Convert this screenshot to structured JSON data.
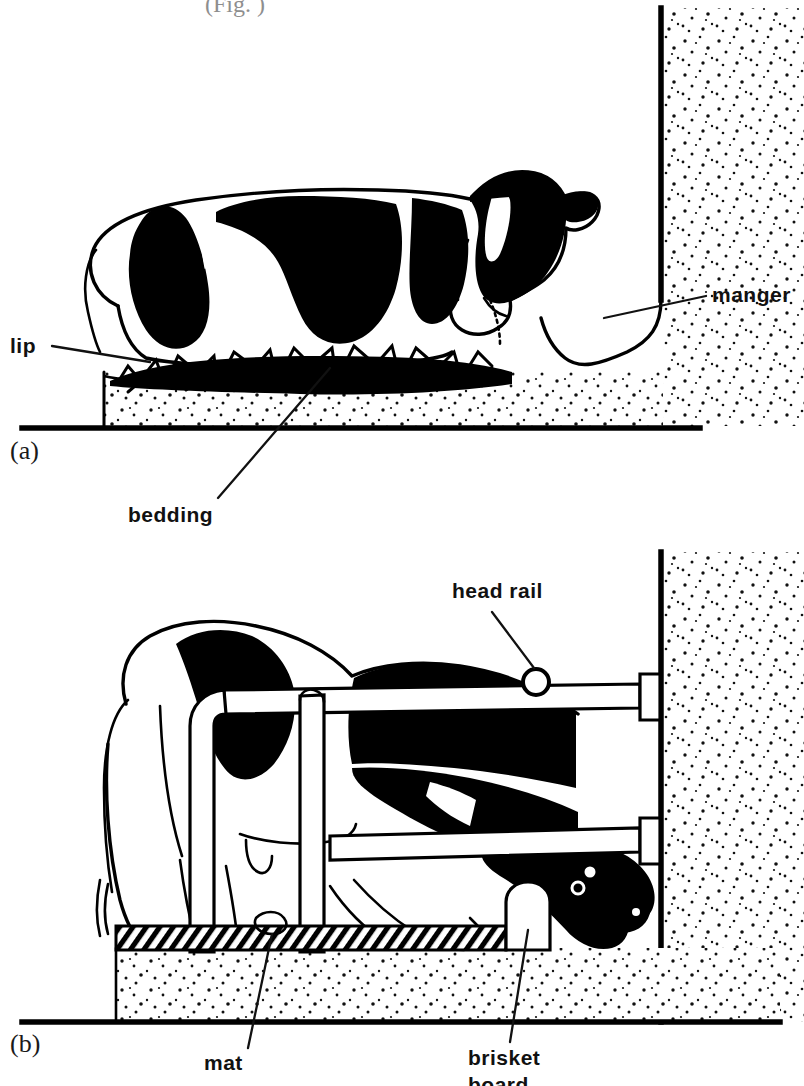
{
  "figure": {
    "top_cut_text": "(Fig. )",
    "panels": [
      {
        "id": "a",
        "marker": "(a)",
        "description": "Cow lying in a straw-bedded stall with a manger at the wall",
        "labels": [
          {
            "name": "lip",
            "text": "lip"
          },
          {
            "name": "manger",
            "text": "manger"
          },
          {
            "name": "bedding",
            "text": "bedding"
          }
        ]
      },
      {
        "id": "b",
        "marker": "(b)",
        "description": "Cow standing in a cubicle with head rail, mat and brisket board",
        "labels": [
          {
            "name": "head-rail",
            "text": "head rail"
          },
          {
            "name": "mat",
            "text": "mat"
          },
          {
            "name": "brisket-board-line1",
            "text": "brisket"
          },
          {
            "name": "brisket-board-line2",
            "text": "board"
          }
        ]
      }
    ],
    "colors": {
      "ink": "#000000",
      "paper": "#ffffff",
      "stipple": "#1a1a1a"
    }
  }
}
